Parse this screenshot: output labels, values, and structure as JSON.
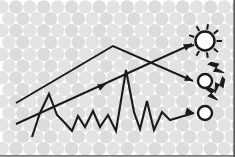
{
  "figure": {
    "name": "photon-scattering-diagram",
    "width": 235,
    "height": 157,
    "background_color": "#ffffff",
    "medium_label": "",
    "caption": ""
  },
  "colors": {
    "background": "#ffffff",
    "medium_circle_fill": "#e3e3e3",
    "medium_circle_fill_alt": "#dcdcdc",
    "path_stroke": "#1a1a1a",
    "border": "#4d4d4d"
  },
  "medium": {
    "name": "scattering-medium",
    "pattern": "hexagonal-close-packed-circles",
    "circle_diameter": 13.6,
    "row_spacing": 11.8,
    "column_spacing": 13.9,
    "rows": 13,
    "columns": 18,
    "x_origin": 2,
    "y_origin": 7
  },
  "paths": {
    "ballistic_upper": {
      "name": "ballistic-ray-to-detector-middle",
      "description": "straight ray entering upper-left, bending at apex, exiting to middle-right detector",
      "points": "16,103 113,46 193,81",
      "arrow_at": "193,81",
      "arrow_angle": 24
    },
    "ballistic_lower": {
      "name": "ballistic-ray-to-sun",
      "description": "straight ray entering lower-left rising to the sun detector",
      "points": "16,124 192,44",
      "arrow_at": "192,44",
      "arrow_angle": -25,
      "mid_arrow_at": "106,84",
      "mid_arrow_angle": -25
    },
    "diffusive": {
      "name": "diffusive-zigzag-path",
      "description": "jagged multiple-scattering path ending at bottom-right detector",
      "points": "32,137 40,113 49,94 57,115 64,122 72,131 78,116 85,127 93,111 100,127 108,115 116,131 126,70 134,112 140,129 147,101 154,130 162,112 170,120 194,113",
      "arrow_at": "194,113",
      "arrow_angle": 15
    }
  },
  "detectors": [
    {
      "id": "detector-sun",
      "name": "sun-icon",
      "label": "",
      "type": "sun",
      "cx": 205,
      "cy": 41,
      "r": 9.5,
      "ray_count": 9,
      "ray_inner": 11.5,
      "ray_outer": 17
    },
    {
      "id": "detector-emitting",
      "name": "emitting-particle-icon",
      "label": "",
      "type": "circle-with-bolts",
      "cx": 205,
      "cy": 81,
      "r": 7,
      "bolt_count": 3
    },
    {
      "id": "detector-plain",
      "name": "plain-particle-icon",
      "label": "",
      "type": "circle",
      "cx": 205,
      "cy": 113,
      "r": 7
    }
  ]
}
